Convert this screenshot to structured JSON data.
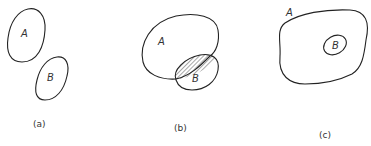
{
  "diagram": {
    "type": "venn-set-relations",
    "panels": [
      {
        "caption": "(a)",
        "relation": "disjoint",
        "sets": [
          {
            "label": "A"
          },
          {
            "label": "B"
          }
        ],
        "hatched_region": "none"
      },
      {
        "caption": "(b)",
        "relation": "overlapping",
        "sets": [
          {
            "label": "A"
          },
          {
            "label": "B"
          }
        ],
        "hatched_region": "A ∩ B"
      },
      {
        "caption": "(c)",
        "relation": "subset (B ⊂ A)",
        "sets": [
          {
            "label": "A"
          },
          {
            "label": "B"
          }
        ],
        "hatched_region": "B"
      }
    ],
    "colors": {
      "stroke": "#222222",
      "background": "#ffffff"
    }
  }
}
